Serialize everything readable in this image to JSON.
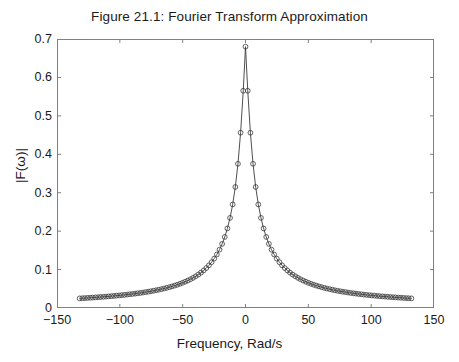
{
  "chart_data": {
    "type": "line",
    "title": "Figure 21.1: Fourier Transform Approximation",
    "xlabel": "Frequency, Rad/s",
    "ylabel": "|F(ω)|",
    "xlim": [
      -150,
      150
    ],
    "ylim": [
      0,
      0.7
    ],
    "xticks": [
      -150,
      -100,
      -50,
      0,
      50,
      100,
      150
    ],
    "xtick_labels": [
      "−150",
      "−100",
      "−50",
      "0",
      "50",
      "100",
      "150"
    ],
    "yticks": [
      0,
      0.1,
      0.2,
      0.3,
      0.4,
      0.5,
      0.6,
      0.7
    ],
    "ytick_labels": [
      "0",
      "0.1",
      "0.2",
      "0.3",
      "0.4",
      "0.5",
      "0.6",
      "0.7"
    ],
    "grid": false,
    "legend": null,
    "marker": "open-circle",
    "line_color": "#3a3a3a",
    "marker_color": "#3a3a3a",
    "axes_color": "#808080",
    "background": "#ffffff",
    "series": [
      {
        "name": "|F(ω)|",
        "x": [
          -132.0,
          -129.9,
          -127.8,
          -125.7,
          -123.6,
          -121.5,
          -119.4,
          -117.3,
          -115.2,
          -113.1,
          -111.0,
          -108.9,
          -106.8,
          -104.7,
          -102.6,
          -100.5,
          -98.4,
          -96.3,
          -94.2,
          -92.1,
          -90.0,
          -87.9,
          -85.8,
          -83.7,
          -81.6,
          -79.5,
          -77.4,
          -75.3,
          -73.2,
          -71.1,
          -69.0,
          -66.9,
          -64.8,
          -62.7,
          -60.6,
          -58.5,
          -56.4,
          -54.3,
          -52.2,
          -50.1,
          -48.0,
          -45.9,
          -43.8,
          -41.7,
          -39.6,
          -37.5,
          -35.4,
          -33.3,
          -31.2,
          -29.1,
          -27.0,
          -24.9,
          -22.8,
          -20.7,
          -18.6,
          -16.5,
          -14.4,
          -12.3,
          -10.2,
          -8.1,
          -6.0,
          -3.9,
          -1.8,
          0.0,
          1.8,
          3.9,
          6.0,
          8.1,
          10.2,
          12.3,
          14.4,
          16.5,
          18.6,
          20.7,
          22.8,
          24.9,
          27.0,
          29.1,
          31.2,
          33.3,
          35.4,
          37.5,
          39.6,
          41.7,
          43.8,
          45.9,
          48.0,
          50.1,
          52.2,
          54.3,
          56.4,
          58.5,
          60.6,
          62.7,
          64.8,
          66.9,
          69.0,
          71.1,
          73.2,
          75.3,
          77.4,
          79.5,
          81.6,
          83.7,
          85.8,
          87.9,
          90.0,
          92.1,
          94.2,
          96.3,
          98.4,
          100.5,
          102.6,
          104.7,
          106.8,
          108.9,
          111.0,
          113.1,
          115.2,
          117.3,
          119.4,
          121.5,
          123.6,
          125.7,
          127.8,
          129.9,
          132.0
        ],
        "y": [
          0.025,
          0.0254,
          0.0258,
          0.0262,
          0.0267,
          0.0271,
          0.0276,
          0.0281,
          0.0286,
          0.0291,
          0.0297,
          0.0302,
          0.0308,
          0.0314,
          0.0321,
          0.0327,
          0.0334,
          0.0341,
          0.0349,
          0.0357,
          0.0365,
          0.0374,
          0.0383,
          0.0392,
          0.0402,
          0.0413,
          0.0424,
          0.0436,
          0.0449,
          0.0462,
          0.0476,
          0.0491,
          0.0507,
          0.0524,
          0.0542,
          0.0562,
          0.0583,
          0.0605,
          0.0629,
          0.0655,
          0.0684,
          0.0714,
          0.0748,
          0.0785,
          0.0826,
          0.0871,
          0.0921,
          0.0977,
          0.104,
          0.1111,
          0.1192,
          0.1285,
          0.1392,
          0.1518,
          0.1668,
          0.1849,
          0.207,
          0.2345,
          0.2695,
          0.3149,
          0.3752,
          0.4561,
          0.5653,
          0.68,
          0.5653,
          0.4561,
          0.3752,
          0.3149,
          0.2695,
          0.2345,
          0.207,
          0.1849,
          0.1668,
          0.1518,
          0.1392,
          0.1285,
          0.1192,
          0.1111,
          0.104,
          0.0977,
          0.0921,
          0.0871,
          0.0826,
          0.0785,
          0.0748,
          0.0714,
          0.0684,
          0.0655,
          0.0629,
          0.0605,
          0.0583,
          0.0562,
          0.0542,
          0.0524,
          0.0507,
          0.0491,
          0.0476,
          0.0462,
          0.0449,
          0.0436,
          0.0424,
          0.0413,
          0.0402,
          0.0392,
          0.0383,
          0.0374,
          0.0365,
          0.0357,
          0.0349,
          0.0341,
          0.0334,
          0.0327,
          0.0321,
          0.0314,
          0.0308,
          0.0302,
          0.0297,
          0.0291,
          0.0286,
          0.0281,
          0.0276,
          0.0271,
          0.0267,
          0.0262,
          0.0258,
          0.0254,
          0.025
        ]
      }
    ]
  }
}
